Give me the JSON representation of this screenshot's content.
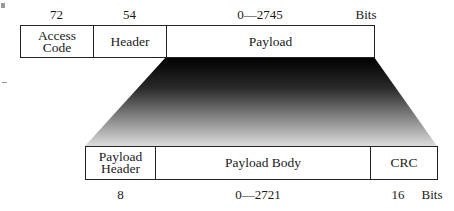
{
  "diagram": {
    "top_row": {
      "fields": [
        {
          "name": "Access Code",
          "label_lines": [
            "Access",
            "Code"
          ],
          "size": "72"
        },
        {
          "name": "Header",
          "label_lines": [
            "Header"
          ],
          "size": "54"
        },
        {
          "name": "Payload",
          "label_lines": [
            "Payload"
          ],
          "size": "0—2745"
        }
      ],
      "unit": "Bits"
    },
    "bottom_row": {
      "expands": "Payload",
      "fields": [
        {
          "name": "Payload Header",
          "label_lines": [
            "Payload",
            "Header"
          ],
          "size": "8"
        },
        {
          "name": "Payload Body",
          "label_lines": [
            "Payload Body"
          ],
          "size": "0—2721"
        },
        {
          "name": "CRC",
          "label_lines": [
            "CRC"
          ],
          "size": "16"
        }
      ],
      "unit": "Bits"
    },
    "colors": {
      "border": "#222222",
      "gradient_top": "#000000",
      "gradient_bottom": "#d8d8d8",
      "background": "#ffffff"
    }
  }
}
